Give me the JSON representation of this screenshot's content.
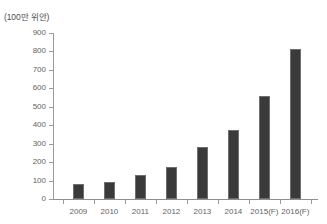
{
  "chart_data": {
    "type": "bar",
    "title": "",
    "subtitle": "",
    "unit_label": "(100만 위안)",
    "xlabel": "",
    "ylabel": "",
    "categories": [
      "2009",
      "2010",
      "2011",
      "2012",
      "2013",
      "2014",
      "2015(F)",
      "2016(F)"
    ],
    "values": [
      80,
      90,
      130,
      175,
      280,
      375,
      560,
      815
    ],
    "series": [
      {
        "name": "",
        "values": [
          80,
          90,
          130,
          175,
          280,
          375,
          560,
          815
        ]
      }
    ],
    "ylim": [
      0,
      900
    ],
    "y_ticks": [
      0,
      100,
      200,
      300,
      400,
      500,
      600,
      700,
      800,
      900
    ],
    "y_tick_labels": [
      "0",
      "100",
      "200",
      "300",
      "400",
      "500",
      "600",
      "700",
      "800",
      "900"
    ],
    "grid": false,
    "legend": false,
    "legend_position": "none",
    "colors": {
      "bar_fill": "#3a3a3a",
      "bar_border": "#6f6f6f",
      "axis": "#9a9a9a",
      "text": "#5f5f5f",
      "background": "#ffffff"
    }
  }
}
